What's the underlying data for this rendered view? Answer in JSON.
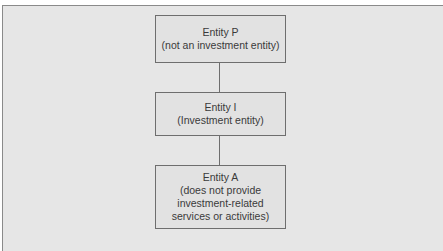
{
  "diagram": {
    "nodes": [
      {
        "id": "P",
        "title": "Entity P",
        "subtitle_lines": [
          "(not an investment entity)"
        ]
      },
      {
        "id": "I",
        "title": "Entity I",
        "subtitle_lines": [
          "(Investment entity)"
        ]
      },
      {
        "id": "A",
        "title": "Entity A",
        "subtitle_lines": [
          "(does not provide",
          "investment-related",
          "services or activities)"
        ]
      }
    ],
    "edges": [
      {
        "from": "P",
        "to": "I"
      },
      {
        "from": "I",
        "to": "A"
      }
    ]
  },
  "colors": {
    "background": "#e6e6e6",
    "box_border": "#6e6e6e",
    "text": "#3a3a3a"
  }
}
